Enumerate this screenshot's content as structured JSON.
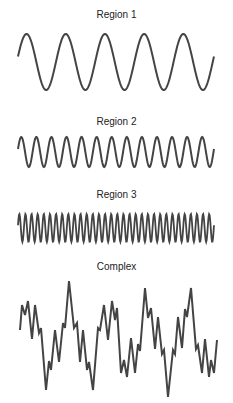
{
  "panels": [
    {
      "label": "Region 1",
      "type": "sine",
      "cycles": 5,
      "x0": 18,
      "x1": 214,
      "center_y": 62,
      "amplitude": 28,
      "label_top": 9
    },
    {
      "label": "Region 2",
      "type": "sine",
      "cycles": 13,
      "x0": 18,
      "x1": 214,
      "center_y": 152,
      "amplitude": 15,
      "label_top": 116
    },
    {
      "label": "Region 3",
      "type": "sine",
      "cycles": 32,
      "x0": 18,
      "x1": 214,
      "center_y": 228,
      "amplitude": 14,
      "label_top": 189
    },
    {
      "label": "Complex",
      "type": "polyline",
      "label_top": 261,
      "points": [
        [
          20,
          330
        ],
        [
          22,
          305
        ],
        [
          25,
          315
        ],
        [
          28,
          301
        ],
        [
          32,
          339
        ],
        [
          35,
          305
        ],
        [
          39,
          333
        ],
        [
          41,
          328
        ],
        [
          46,
          390
        ],
        [
          49,
          361
        ],
        [
          51,
          370
        ],
        [
          55,
          330
        ],
        [
          59,
          362
        ],
        [
          63,
          323
        ],
        [
          65,
          328
        ],
        [
          69,
          281
        ],
        [
          74,
          328
        ],
        [
          77,
          323
        ],
        [
          80,
          362
        ],
        [
          83,
          330
        ],
        [
          87,
          370
        ],
        [
          89,
          362
        ],
        [
          93,
          390
        ],
        [
          98,
          328
        ],
        [
          100,
          330
        ],
        [
          104,
          305
        ],
        [
          108,
          340
        ],
        [
          112,
          301
        ],
        [
          115,
          320
        ],
        [
          117,
          308
        ],
        [
          121,
          373
        ],
        [
          124,
          360
        ],
        [
          127,
          377
        ],
        [
          131,
          338
        ],
        [
          135,
          373
        ],
        [
          138,
          344
        ],
        [
          140,
          351
        ],
        [
          145,
          288
        ],
        [
          148,
          318
        ],
        [
          151,
          308
        ],
        [
          155,
          349
        ],
        [
          158,
          317
        ],
        [
          162,
          354
        ],
        [
          164,
          350
        ],
        [
          168,
          397
        ],
        [
          173,
          350
        ],
        [
          175,
          354
        ],
        [
          178,
          317
        ],
        [
          182,
          348
        ],
        [
          185,
          309
        ],
        [
          187,
          317
        ],
        [
          191,
          288
        ],
        [
          196,
          349
        ],
        [
          198,
          345
        ],
        [
          202,
          373
        ],
        [
          205,
          339
        ],
        [
          209,
          377
        ],
        [
          211,
          360
        ],
        [
          214,
          373
        ],
        [
          217,
          340
        ]
      ]
    }
  ],
  "colors": {
    "line": "#444444",
    "text": "#222222"
  }
}
